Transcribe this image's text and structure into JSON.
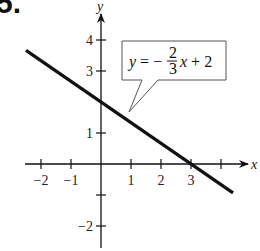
{
  "problem_number": "5.",
  "chart_data": {
    "type": "line",
    "title": "",
    "xlabel": "x",
    "ylabel": "y",
    "xlim": [
      -2.3,
      4.7
    ],
    "ylim": [
      -2.3,
      4.6
    ],
    "grid": false,
    "x_ticks": [
      -2,
      -1,
      1,
      2,
      3,
      4
    ],
    "x_tick_labels": [
      "−2",
      "−1",
      "1",
      "2",
      "3",
      ""
    ],
    "y_ticks": [
      -2,
      -1,
      1,
      3,
      4
    ],
    "y_tick_labels": [
      "−2",
      "",
      "1",
      "3",
      "4"
    ],
    "series": [
      {
        "name": "y = -2/3 x + 2",
        "equation": "y = −(2/3)x + 2",
        "slope": -0.6667,
        "intercept": 2,
        "x": [
          -2.5,
          4.4
        ],
        "y": [
          3.6667,
          -0.9333
        ],
        "color": "#111111"
      }
    ],
    "key_points": [
      {
        "label": "y-intercept",
        "x": 0,
        "y": 2
      },
      {
        "label": "x-intercept",
        "x": 3,
        "y": 0
      }
    ],
    "annotation": {
      "text_prefix": "y = −",
      "fraction_numerator": "2",
      "fraction_denominator": "3",
      "text_suffix": "x + 2",
      "points_to": {
        "x": 1,
        "y": 1.333
      }
    }
  }
}
